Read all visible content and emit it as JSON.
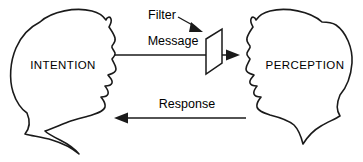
{
  "diagram": {
    "background_color": "#ffffff",
    "stroke_color": "#1a1a1a",
    "text_color": "#000000",
    "nodes": [
      {
        "id": "sender",
        "label": "INTENTION",
        "shape": "head-silhouette",
        "facing": "right"
      },
      {
        "id": "receiver",
        "label": "PERCEPTION",
        "shape": "head-silhouette",
        "facing": "left"
      },
      {
        "id": "filter",
        "label": "Filter",
        "shape": "parallelogram-plane"
      }
    ],
    "edges": [
      {
        "id": "message",
        "label": "Message",
        "from": "sender",
        "to": "receiver",
        "direction": "right",
        "passes_through": "filter"
      },
      {
        "id": "response",
        "label": "Response",
        "from": "receiver",
        "to": "sender",
        "direction": "left"
      }
    ]
  }
}
